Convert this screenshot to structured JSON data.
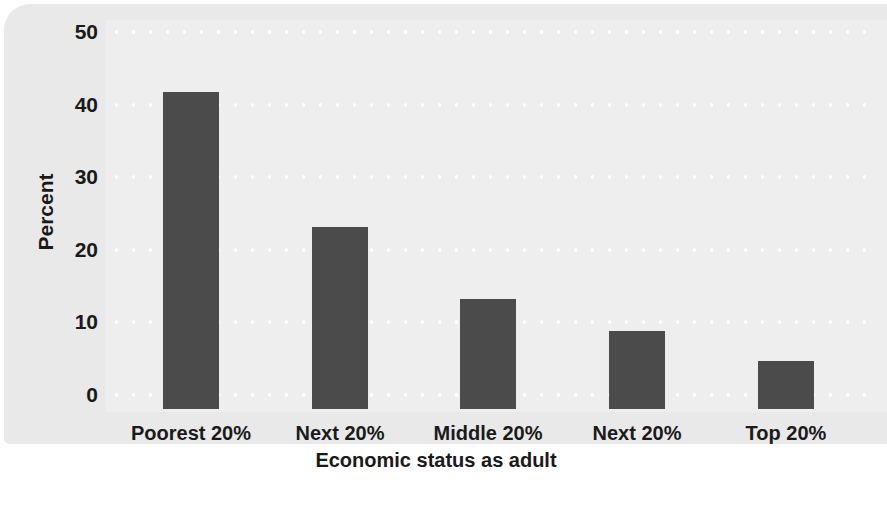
{
  "chart_data": {
    "type": "bar",
    "title": "",
    "categories": [
      "Poorest 20%",
      "Next 20%",
      "Middle 20%",
      "Next 20%",
      "Top 20%"
    ],
    "values": [
      42.5,
      24.4,
      14.7,
      10.5,
      6.5
    ],
    "xlabel": "Economic status as adult",
    "ylabel": "Percent",
    "yticks": [
      "0",
      "10",
      "20",
      "30",
      "40",
      "50"
    ],
    "ylim": [
      0,
      50
    ],
    "grid": "horizontal-dotted-white",
    "legend": "none",
    "bar_color": "#4b4b4b",
    "panel_color": "#e9e9e9",
    "plot_color": "#eeeeee"
  },
  "background_text": {
    "lines": [
      "mobility has declined in recent decades.",
      "rates had fallen",
      "that the chances of moving",
      "poorer a family started out, the",
      "much more likely they were",
      "children in the bottom fifth remained",
      "the bottom fifth as adults",
      "income distribution, only a small",
      "share reached the top"
    ]
  }
}
